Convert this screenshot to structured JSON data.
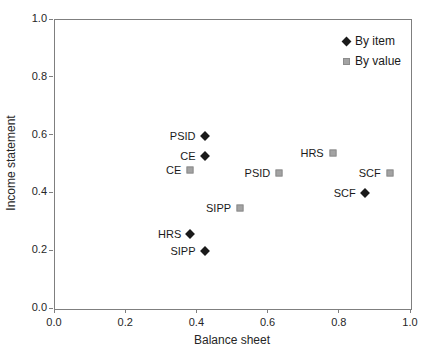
{
  "chart_data": {
    "type": "scatter",
    "title": "",
    "xlabel": "Balance sheet",
    "ylabel": "Income statement",
    "xlim": [
      0.0,
      1.0
    ],
    "ylim": [
      0.0,
      1.0
    ],
    "xticks": [
      "0.0",
      "0.2",
      "0.4",
      "0.6",
      "0.8",
      "1.0"
    ],
    "yticks": [
      "0.0",
      "0.2",
      "0.4",
      "0.6",
      "0.8",
      "1.0"
    ],
    "grid": "off",
    "legend_position": "top-right-inside",
    "colors": {
      "by_item": "#1a1a1a",
      "by_value": "#a3a3a3",
      "by_value_border": "#8c8c8c",
      "axis": "#7f7f7f"
    },
    "series": [
      {
        "name": "By item",
        "marker": "diamond",
        "color": "#1a1a1a",
        "points": [
          {
            "label": "PSID",
            "x": 0.42,
            "y": 0.6
          },
          {
            "label": "CE",
            "x": 0.42,
            "y": 0.53
          },
          {
            "label": "HRS",
            "x": 0.38,
            "y": 0.26
          },
          {
            "label": "SIPP",
            "x": 0.42,
            "y": 0.2
          },
          {
            "label": "SCF",
            "x": 0.87,
            "y": 0.4
          }
        ]
      },
      {
        "name": "By value",
        "marker": "square",
        "color": "#a3a3a3",
        "points": [
          {
            "label": "CE",
            "x": 0.38,
            "y": 0.48
          },
          {
            "label": "SIPP",
            "x": 0.52,
            "y": 0.35
          },
          {
            "label": "PSID",
            "x": 0.63,
            "y": 0.47
          },
          {
            "label": "HRS",
            "x": 0.78,
            "y": 0.54
          },
          {
            "label": "SCF",
            "x": 0.94,
            "y": 0.47
          }
        ]
      }
    ]
  }
}
